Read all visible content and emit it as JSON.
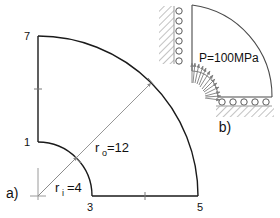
{
  "figure": {
    "title_a": "a)",
    "title_b": "b)",
    "colors": {
      "outline": "#000000",
      "thin_line": "#7a7a7a",
      "hatch": "#b0b0b0",
      "text": "#111111"
    }
  },
  "panel_a": {
    "name": "quarter-annulus-mesh-geometry",
    "label": "a)",
    "node_labels": [
      {
        "id": "node-7",
        "text": "7",
        "x": 27,
        "y": 40
      },
      {
        "id": "node-1",
        "text": "1",
        "x": 27,
        "y": 145
      },
      {
        "id": "node-3",
        "text": "3",
        "x": 89,
        "y": 211
      },
      {
        "id": "node-5",
        "text": "5",
        "x": 199,
        "y": 211
      }
    ],
    "dimensions": [
      {
        "id": "outer-radius",
        "base": "r",
        "sub": "o",
        "value": "=12",
        "full_text": "ro=12",
        "x": 95,
        "y": 152
      },
      {
        "id": "inner-radius",
        "base": "r",
        "sub": "i",
        "value": "=4",
        "full_text": "ri =4",
        "x": 55,
        "y": 190
      }
    ],
    "geometry": {
      "center_x": 38,
      "center_y": 196,
      "inner_radius_px": 54,
      "outer_radius_px": 160,
      "inner_radius_value": 4,
      "outer_radius_value": 12
    }
  },
  "panel_b": {
    "name": "boundary-conditions-diagram",
    "label": "b)",
    "pressure_label": "P=100MPa",
    "left_roller_count": 6,
    "bottom_roller_count": 5,
    "pressure_arrow_count": 13,
    "geometry": {
      "center_x": 192,
      "center_y": 97,
      "inner_radius_px": 26,
      "outer_radius_px": 92
    }
  }
}
